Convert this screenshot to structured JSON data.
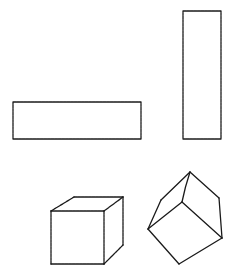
{
  "canvas": {
    "width": 234,
    "height": 274,
    "background": "#ffffff"
  },
  "style": {
    "stroke_color": "#1a1a1a",
    "stroke_width": 1.3
  },
  "shapes": [
    {
      "name": "horizontal-rectangle",
      "type": "rectangle",
      "x": 13,
      "y": 102,
      "width": 128,
      "height": 37
    },
    {
      "name": "vertical-rectangle",
      "type": "rectangle",
      "x": 183,
      "y": 11,
      "width": 38,
      "height": 128
    },
    {
      "name": "upright-cube",
      "type": "cube",
      "points": {
        "front_tl": [
          51,
          211
        ],
        "front_tr": [
          104,
          211
        ],
        "front_br": [
          104,
          264
        ],
        "front_bl": [
          51,
          264
        ],
        "back_tl": [
          74,
          197
        ],
        "back_tr": [
          123,
          197
        ],
        "back_br": [
          123,
          245
        ]
      }
    },
    {
      "name": "tilted-cube",
      "type": "cube",
      "points": {
        "top": [
          190,
          172
        ],
        "right_top": [
          219,
          198
        ],
        "right_bottom": [
          222,
          238
        ],
        "bottom": [
          179,
          264
        ],
        "left": [
          148,
          229
        ],
        "upper_left": [
          161,
          200
        ],
        "inner": [
          182,
          202
        ]
      }
    }
  ]
}
